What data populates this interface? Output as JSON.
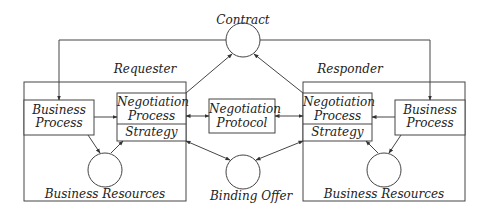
{
  "diagram": {
    "title_contract": "Contract",
    "binding_offer": "Binding Offer",
    "protocol": {
      "line1": "Negotiation",
      "line2": "Protocol"
    },
    "requester": {
      "label": "Requester",
      "business_process": {
        "line1": "Business",
        "line2": "Process"
      },
      "negotiation": {
        "line1": "Negotiation",
        "line2": "Process",
        "strategy": "Strategy"
      },
      "resources": "Business Resources"
    },
    "responder": {
      "label": "Responder",
      "business_process": {
        "line1": "Business",
        "line2": "Process"
      },
      "negotiation": {
        "line1": "Negotiation",
        "line2": "Process",
        "strategy": "Strategy"
      },
      "resources": "Business Resources"
    },
    "colors": {
      "stroke": "#444444",
      "text": "#222222",
      "background": "#ffffff"
    }
  }
}
